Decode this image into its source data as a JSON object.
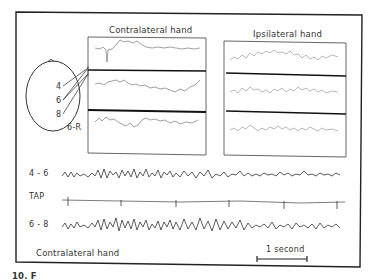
{
  "figure": {
    "panels": {
      "contralateral": {
        "title": "Contralateral hand"
      },
      "ipsilateral": {
        "title": "Ipsilateral hand"
      }
    },
    "head_diagram": {
      "electrodes": [
        "4",
        "6",
        "8",
        "6-R"
      ]
    },
    "traces": [
      {
        "label": "4 - 6"
      },
      {
        "label": "TAP"
      },
      {
        "label": "6 - 8"
      }
    ],
    "bottom_label": "Contralateral hand",
    "scale_bar": {
      "label": "1 second"
    },
    "caption_fragment": "10. F"
  }
}
